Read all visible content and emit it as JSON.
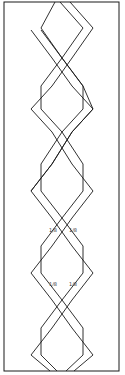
{
  "diagram": {
    "type": "braided-double-zigzag-pattern",
    "stroke_color": "#1a1a1a",
    "background": "#ffffff",
    "border": {
      "x": 4,
      "y": 2,
      "width": 115,
      "height": 369
    },
    "annotations": [
      {
        "text": "1/8",
        "x": 49,
        "y": 228
      },
      {
        "text": "1/8",
        "x": 69,
        "y": 228
      },
      {
        "text": "1/8",
        "x": 49,
        "y": 282
      },
      {
        "text": "1/8",
        "x": 69,
        "y": 282
      }
    ]
  }
}
